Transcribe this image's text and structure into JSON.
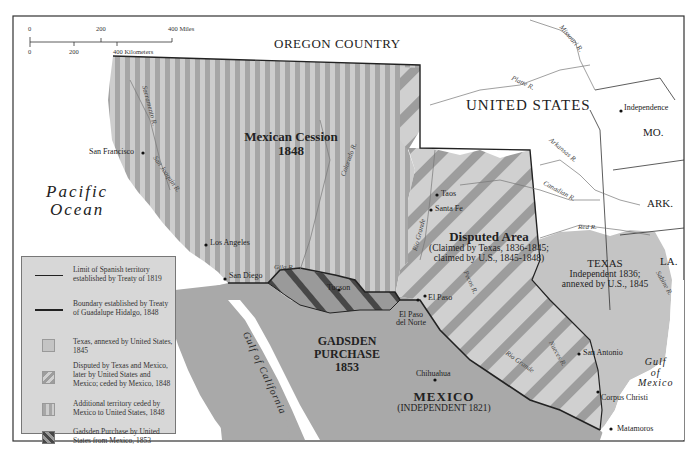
{
  "scale_bar": {
    "miles_ticks": [
      "0",
      "200",
      "400 Miles"
    ],
    "km_ticks": [
      "0",
      "200",
      "400 Kilometers"
    ]
  },
  "regions": {
    "oregon_country": "OREGON COUNTRY",
    "united_states": "UNITED STATES",
    "mexican_cession": {
      "name": "Mexican Cession",
      "year": "1848"
    },
    "disputed_area": {
      "name": "Disputed Area",
      "line1": "(Claimed by Texas, 1836-1845;",
      "line2": "claimed by U.S., 1845-1848)"
    },
    "texas": {
      "name": "TEXAS",
      "line1": "Independent 1836;",
      "line2": "annexed by U.S., 1845"
    },
    "gadsden": {
      "line1": "GADSDEN",
      "line2": "PURCHASE",
      "year": "1853"
    },
    "mexico": {
      "name": "MEXICO",
      "sub": "(INDEPENDENT 1821)"
    }
  },
  "states": {
    "mo": "MO.",
    "ark": "ARK.",
    "la": "LA."
  },
  "water": {
    "pacific": {
      "line1": "Pacific",
      "line2": "Ocean"
    },
    "gulf_mexico": {
      "line1": "Gulf",
      "line2": "of",
      "line3": "Mexico"
    },
    "gulf_california": "Gulf of California"
  },
  "cities": {
    "san_francisco": "San Francisco",
    "los_angeles": "Los Angeles",
    "san_diego": "San Diego",
    "tucson": "Tucson",
    "el_paso": "El Paso",
    "el_paso_norte_1": "El Paso",
    "el_paso_norte_2": "del Norte",
    "chihuahua": "Chihuahua",
    "taos": "Taos",
    "santa_fe": "Santa Fe",
    "independence": "Independence",
    "san_antonio": "San Antonio",
    "corpus_christi": "Corpus Christi",
    "matamoros": "Matamoros"
  },
  "rivers": {
    "missouri": "Missouri R.",
    "platte": "Platte R.",
    "arkansas": "Arkansas R.",
    "canadian": "Canadian R.",
    "red": "Red R.",
    "sabine": "Sabine R.",
    "rio_grande_north": "Rio Grande",
    "rio_grande_south": "Rio Grande",
    "pecos": "Pecos R.",
    "nueces": "Nueces R.",
    "colorado": "Colorado R.",
    "gila": "Gila R.",
    "sacramento": "Sacramento R.",
    "san_joaquin": "San Joaquin R."
  },
  "legend": {
    "items": [
      {
        "symbol": "line-thin",
        "text": "Limit of Spanish territory established by Treaty of 1819"
      },
      {
        "symbol": "line-thick",
        "text": "Boundary established by Treaty of Guadalupe Hidalgo, 1848"
      },
      {
        "symbol": "swatch-texas",
        "text": "Texas, annexed by United States, 1845"
      },
      {
        "symbol": "swatch-disputed",
        "text": "Disputed by Texas and Mexico, later by United States and Mexico; ceded by Mexico, 1848"
      },
      {
        "symbol": "swatch-cession",
        "text": "Additional territory ceded by Mexico to United States, 1848"
      },
      {
        "symbol": "swatch-gadsden",
        "text": "Gadsden Purchase by United States from Mexico, 1853"
      }
    ]
  },
  "colors": {
    "land_us": "#ffffff",
    "mexico": "#a9a9a9",
    "texas": "#c4c4c4",
    "stripe_light": "#c8c8c8",
    "stripe_dark": "#a0a0a0",
    "disputed_light": "#cfcfcf",
    "disputed_dark": "#9c9c9c",
    "gadsden_dark": "#4a4a4a",
    "legend_bg": "#d7d7d7"
  }
}
